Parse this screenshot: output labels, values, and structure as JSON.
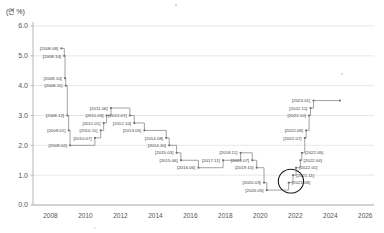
{
  "unit_label": "(연 %)",
  "chart_data": {
    "type": "line",
    "title": "",
    "subtitle": "",
    "xlabel": "",
    "ylabel": "",
    "unit": "연 %",
    "step_style": "post",
    "grid": true,
    "legend": null,
    "xlim": [
      2007.0,
      2026.5
    ],
    "ylim": [
      0.0,
      6.0
    ],
    "yticks": [
      "0.0",
      "1.0",
      "2.0",
      "3.0",
      "4.0",
      "5.0",
      "6.0"
    ],
    "ytick_values": [
      0.0,
      1.0,
      2.0,
      3.0,
      4.0,
      5.0,
      6.0
    ],
    "xticks": [
      "2008",
      "2010",
      "2012",
      "2014",
      "2016",
      "2018",
      "2020",
      "2022",
      "2024",
      "2026"
    ],
    "xtick_values": [
      2008,
      2010,
      2012,
      2014,
      2016,
      2018,
      2020,
      2022,
      2024,
      2026
    ],
    "points": [
      {
        "label": "[2008.08]",
        "date": "2008.08",
        "x": 2008.62,
        "y": 5.25,
        "side": "left"
      },
      {
        "label": "[2008.10]",
        "date": "2008.10",
        "x": 2008.79,
        "y": 5.0,
        "side": "left"
      },
      {
        "label": "[2008.10]",
        "date": "2008.10",
        "x": 2008.83,
        "y": 4.25,
        "side": "left"
      },
      {
        "label": "[2008.11]",
        "date": "2008.11",
        "x": 2008.87,
        "y": 4.0,
        "side": "left"
      },
      {
        "label": "[2008.12]",
        "date": "2008.12",
        "x": 2008.96,
        "y": 3.0,
        "side": "left"
      },
      {
        "label": "[2009.01]",
        "date": "2009.01",
        "x": 2009.04,
        "y": 2.5,
        "side": "left"
      },
      {
        "label": "[2009.02]",
        "date": "2009.02",
        "x": 2009.12,
        "y": 2.0,
        "side": "left"
      },
      {
        "label": "[2010.07]",
        "date": "2010.07",
        "x": 2010.54,
        "y": 2.25,
        "side": "left"
      },
      {
        "label": "[2010.11]",
        "date": "2010.11",
        "x": 2010.87,
        "y": 2.5,
        "side": "left"
      },
      {
        "label": "[2011.01]",
        "date": "2011.01",
        "x": 2011.04,
        "y": 2.75,
        "side": "left"
      },
      {
        "label": "[2011.03]",
        "date": "2011.03",
        "x": 2011.21,
        "y": 3.0,
        "side": "left"
      },
      {
        "label": "[2011.06]",
        "date": "2011.06",
        "x": 2011.46,
        "y": 3.25,
        "side": "left"
      },
      {
        "label": "[2012.07]",
        "date": "2012.07",
        "x": 2012.54,
        "y": 3.0,
        "side": "left"
      },
      {
        "label": "[2012.10]",
        "date": "2012.10",
        "x": 2012.79,
        "y": 2.75,
        "side": "left"
      },
      {
        "label": "[2013.05]",
        "date": "2013.05",
        "x": 2013.37,
        "y": 2.5,
        "side": "left"
      },
      {
        "label": "[2014.08]",
        "date": "2014.08",
        "x": 2014.62,
        "y": 2.25,
        "side": "left"
      },
      {
        "label": "[2014.10]",
        "date": "2014.10",
        "x": 2014.79,
        "y": 2.0,
        "side": "left"
      },
      {
        "label": "[2015.03]",
        "date": "2015.03",
        "x": 2015.21,
        "y": 1.75,
        "side": "left"
      },
      {
        "label": "[2015.06]",
        "date": "2015.06",
        "x": 2015.46,
        "y": 1.5,
        "side": "left"
      },
      {
        "label": "[2016.06]",
        "date": "2016.06",
        "x": 2016.46,
        "y": 1.25,
        "side": "left"
      },
      {
        "label": "[2017.11]",
        "date": "2017.11",
        "x": 2017.87,
        "y": 1.5,
        "side": "left"
      },
      {
        "label": "[2018.11]",
        "date": "2018.11",
        "x": 2018.87,
        "y": 1.75,
        "side": "left"
      },
      {
        "label": "[2019.07]",
        "date": "2019.07",
        "x": 2019.54,
        "y": 1.5,
        "side": "left"
      },
      {
        "label": "[2019.10]",
        "date": "2019.10",
        "x": 2019.79,
        "y": 1.25,
        "side": "left"
      },
      {
        "label": "[2020.03]",
        "date": "2020.03",
        "x": 2020.21,
        "y": 0.75,
        "side": "left"
      },
      {
        "label": "[2020.05]",
        "date": "2020.05",
        "x": 2020.37,
        "y": 0.5,
        "side": "left"
      },
      {
        "label": "[2021.08]",
        "date": "2021.08",
        "x": 2021.62,
        "y": 0.75,
        "side": "right"
      },
      {
        "label": "[2021.11]",
        "date": "2021.11",
        "x": 2021.87,
        "y": 1.0,
        "side": "right"
      },
      {
        "label": "[2022.01]",
        "date": "2022.01",
        "x": 2022.04,
        "y": 1.25,
        "side": "right"
      },
      {
        "label": "[2022.04]",
        "date": "2022.04",
        "x": 2022.29,
        "y": 1.5,
        "side": "right"
      },
      {
        "label": "[2022.05]",
        "date": "2022.05",
        "x": 2022.37,
        "y": 1.75,
        "side": "right"
      },
      {
        "label": "[2022.07]",
        "date": "2022.07",
        "x": 2022.54,
        "y": 2.25,
        "side": "left"
      },
      {
        "label": "[2022.08]",
        "date": "2022.08",
        "x": 2022.62,
        "y": 2.5,
        "side": "left"
      },
      {
        "label": "[2022.10]",
        "date": "2022.10",
        "x": 2022.79,
        "y": 3.0,
        "side": "left"
      },
      {
        "label": "[2022.11]",
        "date": "2022.11",
        "x": 2022.87,
        "y": 3.25,
        "side": "left"
      },
      {
        "label": "[2023.01]",
        "date": "2023.01",
        "x": 2023.04,
        "y": 3.5,
        "side": "left"
      },
      {
        "label": "",
        "date": "2023.12",
        "x": 2024.55,
        "y": 3.5,
        "side": "none"
      }
    ],
    "annotations": [
      {
        "type": "circle",
        "name": "highlight-circle",
        "x": 2021.75,
        "y": 0.8,
        "rx": 0.72,
        "ry": 0.4
      }
    ]
  }
}
